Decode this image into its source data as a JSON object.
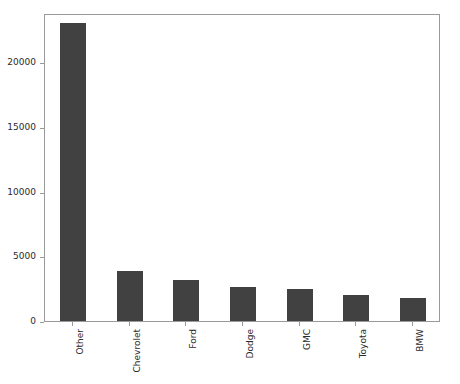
{
  "chart_data": {
    "type": "bar",
    "title": "",
    "subtitle": "",
    "xlabel": "",
    "ylabel": "",
    "categories": [
      "Other",
      "Chevrolet",
      "Ford",
      "Dodge",
      "GMC",
      "Toyota",
      "BMW"
    ],
    "values": [
      23000,
      3900,
      3200,
      2600,
      2450,
      2000,
      1800
    ],
    "ylim": [
      0,
      23800
    ],
    "xlim": [
      -0.5,
      6.5
    ],
    "yticks": [
      0,
      5000,
      10000,
      15000,
      20000
    ],
    "ytick_labels": [
      "0",
      "5000",
      "10000",
      "15000",
      "20000"
    ],
    "xtick_label_rotation": 90,
    "grid": false,
    "legend": null,
    "bar_color": "#414141",
    "axes_edge_color": "#9a9a9a",
    "tick_label_color": "#2b2b2b",
    "background_color": "#ffffff",
    "bar_width_ratio": 0.46
  }
}
